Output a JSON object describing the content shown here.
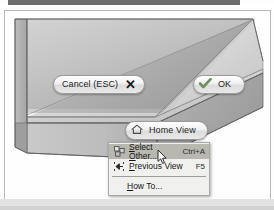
{
  "viewport": {
    "model_label": "3d-solid-model",
    "background_color": "#fefefe",
    "border_color": "#b9b9b9"
  },
  "buttons": {
    "cancel": {
      "label": "Cancel (ESC)",
      "icon": "close-x-icon"
    },
    "ok": {
      "label": "OK",
      "icon": "check-icon",
      "icon_color": "#6f8f63"
    },
    "home_view": {
      "label": "Home View",
      "icon": "home-icon"
    }
  },
  "context_menu": {
    "items": [
      {
        "label": "Select Other...",
        "shortcut": "Ctrl+A",
        "icon": "select-other-icon",
        "highlighted": true,
        "underline": "O"
      },
      {
        "label": "Previous View",
        "shortcut": "F5",
        "icon": "previous-view-icon",
        "highlighted": false,
        "underline": "P"
      },
      {
        "label": "How To...",
        "shortcut": "",
        "icon": "",
        "highlighted": false,
        "underline": "H"
      }
    ],
    "highlight_color": "#b8b8b0",
    "background_color": "#f0f0ee"
  },
  "cursor": {
    "type": "arrow-pointer"
  }
}
